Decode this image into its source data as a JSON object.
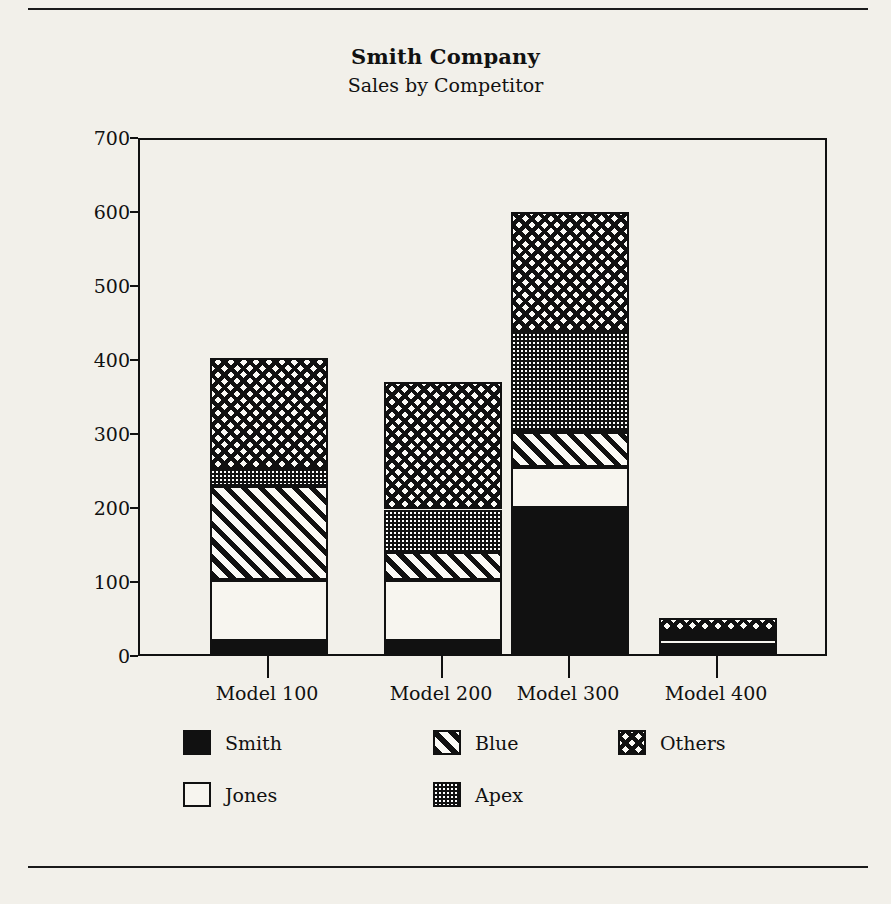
{
  "chart_data": {
    "type": "bar",
    "subtype": "stacked-bar",
    "title": "Smith Company",
    "subtitle": "Sales by Competitor",
    "xlabel": "",
    "ylabel": "Millions of Sales",
    "ylim": [
      0,
      700
    ],
    "ytick_step": 100,
    "yticks": [
      0,
      100,
      200,
      300,
      400,
      500,
      600,
      700
    ],
    "ytick_labels": [
      "0",
      "100",
      "200",
      "300",
      "400",
      "500",
      "600",
      "700"
    ],
    "grid": false,
    "legend_position": "bottom",
    "categories": [
      "Model 100",
      "Model 200",
      "Model 300",
      "Model 400"
    ],
    "series": [
      {
        "name": "Smith",
        "pattern": "solid-black",
        "values": [
          20,
          20,
          200,
          15
        ]
      },
      {
        "name": "Jones",
        "pattern": "white",
        "values": [
          83,
          83,
          55,
          8
        ]
      },
      {
        "name": "Blue",
        "pattern": "diagonal-hatch",
        "values": [
          127,
          37,
          48,
          6
        ]
      },
      {
        "name": "Apex",
        "pattern": "fine-dotted",
        "values": [
          23,
          58,
          135,
          5
        ]
      },
      {
        "name": "Others",
        "pattern": "cross-hatch",
        "values": [
          150,
          172,
          162,
          18
        ]
      }
    ],
    "totals": [
      403,
      370,
      600,
      52
    ]
  },
  "titles": {
    "main": "Smith Company",
    "sub": "Sales by Competitor"
  },
  "axes": {
    "y_title": "Millions of Sales",
    "y_tick_labels": [
      "700",
      "600",
      "500",
      "400",
      "300",
      "200",
      "100",
      "0"
    ],
    "x_tick_labels": [
      "Model 100",
      "Model 200",
      "Model 300",
      "Model 400"
    ]
  },
  "legend": {
    "items": [
      {
        "label": "Smith",
        "pattern": "solid-black"
      },
      {
        "label": "Blue",
        "pattern": "diagonal-hatch"
      },
      {
        "label": "Others",
        "pattern": "cross-hatch"
      },
      {
        "label": "Jones",
        "pattern": "white"
      },
      {
        "label": "Apex",
        "pattern": "fine-dotted"
      }
    ]
  },
  "colors": {
    "ink": "#111111",
    "paper": "#f2f0ea"
  }
}
